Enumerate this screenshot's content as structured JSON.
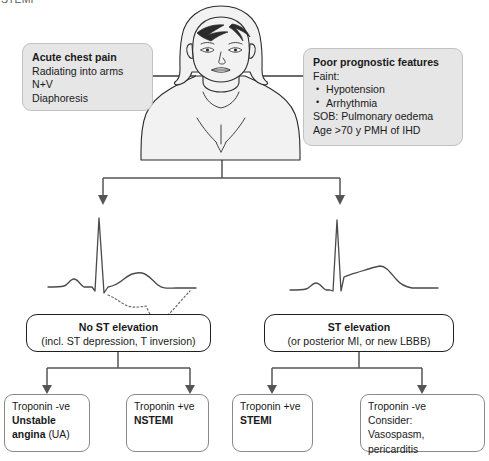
{
  "page": {
    "clipped_title": "STEMI",
    "width": 489,
    "height": 461,
    "background": "#ffffff"
  },
  "colors": {
    "box_fill_gray": "#e6e6e6",
    "box_border_gray": "#c2c2c2",
    "decision_border": "#1f1f1f",
    "outcome_border": "#8a8a8a",
    "connector": "#555555",
    "figure_line": "#2b2b2b",
    "figure_fill": "#f2f2f2",
    "ecg_line": "#4a4a4a",
    "text": "#1a1a1a"
  },
  "figure": {
    "name": "patient-torso-illustration"
  },
  "symptoms_box": {
    "heading": "Acute chest pain",
    "lines": [
      "Radiating into arms",
      "N+V",
      "Diaphoresis"
    ]
  },
  "prognosis_box": {
    "heading": "Poor prognostic features",
    "line_faint": "Faint:",
    "bullets": [
      "Hypotension",
      "Arrhythmia"
    ],
    "line_sob": "SOB: Pulmonary oedema",
    "line_age": "Age >70 y PMH of IHD"
  },
  "ecg": {
    "left": {
      "name": "ecg-no-st-elevation",
      "caption_solid": "normal trace",
      "caption_dotted": "ST depression with T inversion (dotted overlay)"
    },
    "right": {
      "name": "ecg-st-elevation",
      "caption_solid": "ST elevation trace"
    }
  },
  "decisions": [
    {
      "id": "no-st-elevation",
      "heading": "No ST elevation",
      "subtext": "(incl. ST depression, T inversion)"
    },
    {
      "id": "st-elevation",
      "heading": "ST elevation",
      "subtext": "(or posterior MI, or new LBBB)"
    }
  ],
  "outcomes": [
    {
      "id": "unstable-angina",
      "troponin": "Troponin -ve",
      "diagnosis_bold": "Unstable",
      "diagnosis_line2_bold": "angina",
      "diagnosis_line2_rest": " (UA)",
      "extra": ""
    },
    {
      "id": "nstemi",
      "troponin": "Troponin +ve",
      "diagnosis_bold": "NSTEMI",
      "diagnosis_line2_bold": "",
      "diagnosis_line2_rest": "",
      "extra": ""
    },
    {
      "id": "stemi",
      "troponin": "Troponin +ve",
      "diagnosis_bold": "STEMI",
      "diagnosis_line2_bold": "",
      "diagnosis_line2_rest": "",
      "extra": ""
    },
    {
      "id": "vasospasm-pericarditis",
      "troponin": "Troponin -ve",
      "diagnosis_bold": "",
      "diagnosis_line2_bold": "",
      "diagnosis_line2_rest": "",
      "consider_label": "Consider:",
      "extra": "Vasospasm, pericarditis"
    }
  ]
}
